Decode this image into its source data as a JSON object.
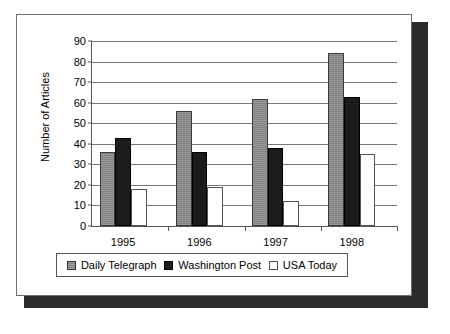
{
  "chart_data": {
    "type": "bar",
    "title": "",
    "xlabel": "",
    "ylabel": "Number of Articles",
    "categories": [
      "1995",
      "1996",
      "1997",
      "1998"
    ],
    "series": [
      {
        "name": "Daily Telegraph",
        "values": [
          36,
          56,
          62,
          84
        ],
        "color": "#8c8c8c"
      },
      {
        "name": "Washington Post",
        "values": [
          43,
          36,
          38,
          63
        ],
        "color": "#1c1c1c"
      },
      {
        "name": "USA Today",
        "values": [
          18,
          19,
          12,
          35
        ],
        "color": "#ffffff"
      }
    ],
    "ylim": [
      0,
      90
    ],
    "ytick_step": 10,
    "yticks": [
      "0",
      "10",
      "20",
      "30",
      "40",
      "50",
      "60",
      "70",
      "80",
      "90"
    ],
    "grid": true,
    "legend_position": "bottom"
  }
}
